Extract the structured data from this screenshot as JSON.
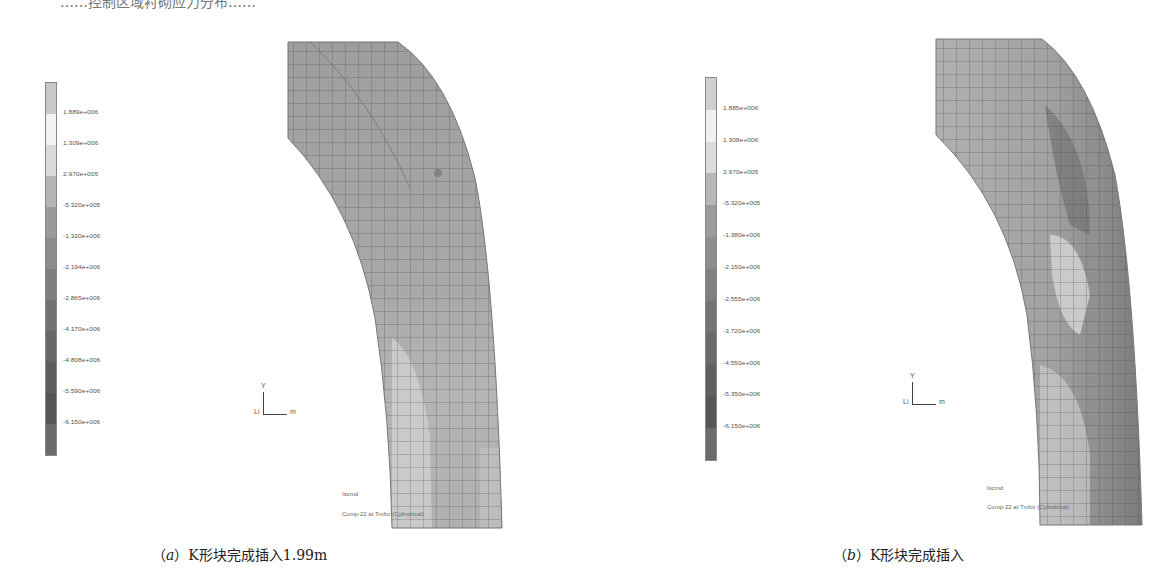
{
  "top_cutoff_text": "……控制区域衬砌应力分布……",
  "figures": [
    {
      "id": "a",
      "caption_prefix": "（",
      "caption_letter": "a",
      "caption_suffix": "）",
      "caption_text": "K形块完成插入1.99m",
      "legend": {
        "labels": [
          "1.889e+006",
          "1.309e+006",
          "2.970e+005",
          "-5.320e+005",
          "-1.320e+006",
          "-2.194e+006",
          "-2.865e+006",
          "-4.170e+006",
          "-4.808e+006",
          "-5.590e+006",
          "-6.150e+006"
        ],
        "colors": [
          "#c8c8c8",
          "#f2f2f2",
          "#dadada",
          "#b4b4b4",
          "#9a9a9a",
          "#8c8c8c",
          "#7e7e7e",
          "#727272",
          "#676767",
          "#5e5e5e",
          "#555555",
          "#6a6a6a"
        ]
      },
      "triad": {
        "y_label": "Y",
        "x_label": "m",
        "origin_label": "Li"
      },
      "info_lines": [
        "Iscmd",
        "Comp-22 at Tmfor (Cylindrical)"
      ]
    },
    {
      "id": "b",
      "caption_prefix": "（",
      "caption_letter": "b",
      "caption_suffix": "）",
      "caption_text": "K形块完成插入",
      "legend": {
        "labels": [
          "1.885e+006",
          "1.308e+006",
          "2.970e+005",
          "-5.320e+005",
          "-1.380e+006",
          "-2.150e+006",
          "-2.555e+006",
          "-3.720e+006",
          "-4.550e+006",
          "-5.350e+006",
          "-6.150e+006"
        ],
        "colors": [
          "#cfcfcf",
          "#f0f0f0",
          "#dcdcdc",
          "#b8b8b8",
          "#9c9c9c",
          "#8e8e8e",
          "#808080",
          "#747474",
          "#6a6a6a",
          "#606060",
          "#575757",
          "#6c6c6c"
        ]
      },
      "triad": {
        "y_label": "Y",
        "x_label": "m",
        "origin_label": "Li"
      },
      "info_lines": [
        "Iscmd",
        "Comp-22 at Tmfor (Cylindrical)"
      ]
    }
  ]
}
